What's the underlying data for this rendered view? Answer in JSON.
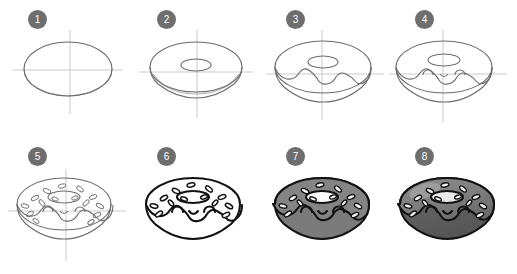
{
  "tutorial": {
    "title": "How to Draw a Donut - 8 Steps",
    "subject": "donut",
    "background_color": "#ffffff",
    "badge_color": "#6e6e6e",
    "badge_text_color": "#ffffff",
    "guide_line_color": "#bdbdbd",
    "sketch_line_color": "#6b6b6b",
    "ink_line_color": "#1a1a1a",
    "glaze_fill_color": "#808080",
    "glaze_shade_color": "#6a6a6a",
    "dough_fill_color": "#7a7a7a",
    "dough_shade_color": "#5e5e5e",
    "sprinkle_color": "#ffffff",
    "columns": 4,
    "rows": 2,
    "steps": [
      {
        "number": "1",
        "badge_label": "1",
        "description": "Draw a large ellipse with crosshair guide lines",
        "stage": "sketch",
        "features": [
          "ellipse",
          "vertical-guide",
          "horizontal-guide"
        ]
      },
      {
        "number": "2",
        "badge_label": "2",
        "description": "Add the donut hole ellipse and the bottom thickness curve",
        "stage": "sketch",
        "features": [
          "ellipse",
          "hole",
          "thickness",
          "guides"
        ]
      },
      {
        "number": "3",
        "badge_label": "3",
        "description": "Draw the wavy dripping glaze edge around the donut",
        "stage": "sketch",
        "features": [
          "ellipse",
          "hole",
          "thickness",
          "glaze-drip",
          "guides"
        ]
      },
      {
        "number": "4",
        "badge_label": "4",
        "description": "Add the face: two eyes and a small smiling mouth",
        "stage": "sketch",
        "features": [
          "glaze-drip",
          "eyes",
          "mouth",
          "guides"
        ]
      },
      {
        "number": "5",
        "badge_label": "5",
        "description": "Scatter oval sprinkles across the glaze",
        "stage": "sketch",
        "features": [
          "glaze-drip",
          "face",
          "sprinkles",
          "guides"
        ]
      },
      {
        "number": "6",
        "badge_label": "6",
        "description": "Ink the final outlines and erase the guide lines",
        "stage": "ink",
        "features": [
          "outline",
          "face",
          "sprinkles"
        ]
      },
      {
        "number": "7",
        "badge_label": "7",
        "description": "Fill with flat gray color for the glaze and dough",
        "stage": "flat-color",
        "features": [
          "outline",
          "face",
          "sprinkles",
          "flat-fill"
        ]
      },
      {
        "number": "8",
        "badge_label": "8",
        "description": "Add shading and highlights to finish the drawing",
        "stage": "shaded",
        "features": [
          "outline",
          "face",
          "sprinkles",
          "shading",
          "highlight"
        ]
      }
    ]
  }
}
